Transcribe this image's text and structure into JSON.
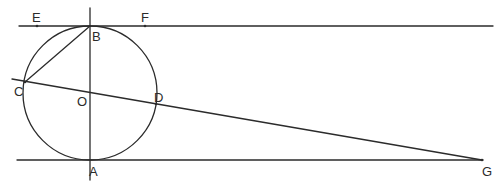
{
  "figure": {
    "type": "geometry-diagram",
    "circle": {
      "center": "O",
      "cx": 90,
      "cy": 93,
      "r": 67
    },
    "points": {
      "E": {
        "label": "E",
        "x": 37,
        "y": 26
      },
      "F": {
        "label": "F",
        "x": 145,
        "y": 26
      },
      "B": {
        "label": "B",
        "x": 90,
        "y": 26
      },
      "C": {
        "label": "C",
        "x": 24,
        "y": 82
      },
      "O": {
        "label": "O",
        "x": 90,
        "y": 93
      },
      "D": {
        "label": "D",
        "x": 156,
        "y": 104
      },
      "A": {
        "label": "A",
        "x": 90,
        "y": 160
      },
      "G": {
        "label": "G",
        "x": 482,
        "y": 160
      }
    },
    "lines": [
      {
        "name": "tangent-EF",
        "through": [
          "E",
          "B",
          "F"
        ]
      },
      {
        "name": "tangent-AG",
        "through": [
          "A",
          "G"
        ]
      },
      {
        "name": "diameter-AB",
        "through": [
          "A",
          "O",
          "B"
        ]
      },
      {
        "name": "secant-CG",
        "through": [
          "C",
          "O",
          "D",
          "G"
        ]
      },
      {
        "name": "chord-BC",
        "through": [
          "B",
          "C"
        ]
      }
    ]
  }
}
